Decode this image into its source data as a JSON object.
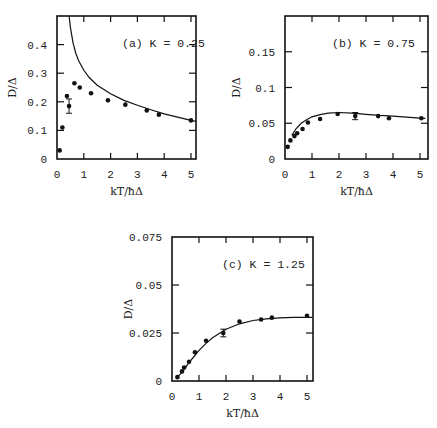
{
  "figure": {
    "panels": [
      "a",
      "b",
      "c"
    ]
  },
  "chart_data": [
    {
      "type": "scatter",
      "title": "(a)  K = 0.25",
      "xlabel": "kT/ħΔ",
      "ylabel": "D/Δ",
      "xlim": [
        0,
        5.2
      ],
      "ylim": [
        0,
        0.5
      ],
      "xticks": [
        0,
        1,
        2,
        3,
        4,
        5
      ],
      "yticks": [
        0,
        0.1,
        0.2,
        0.3,
        0.4
      ],
      "ytick_labels": [
        "0",
        "0.1",
        "0.2",
        "0.3",
        "0.4"
      ],
      "grid": false,
      "series": [
        {
          "name": "simulation points",
          "kind": "points",
          "x": [
            0.1,
            0.2,
            0.37,
            0.45,
            0.65,
            0.85,
            1.27,
            1.9,
            2.55,
            3.35,
            3.8,
            5.0
          ],
          "y": [
            0.03,
            0.11,
            0.22,
            0.185,
            0.265,
            0.25,
            0.23,
            0.205,
            0.19,
            0.17,
            0.155,
            0.135
          ],
          "error_bar": {
            "index": 3,
            "plus_minus": 0.025
          }
        },
        {
          "name": "theory curve",
          "kind": "line",
          "x": [
            0.45,
            0.5,
            0.6,
            0.7,
            0.8,
            1.0,
            1.2,
            1.5,
            2.0,
            2.5,
            3.0,
            3.5,
            4.0,
            4.5,
            5.0,
            5.2
          ],
          "y": [
            0.5,
            0.46,
            0.405,
            0.37,
            0.345,
            0.31,
            0.285,
            0.258,
            0.228,
            0.205,
            0.188,
            0.172,
            0.158,
            0.146,
            0.135,
            0.131
          ]
        }
      ]
    },
    {
      "type": "scatter",
      "title": "(b)  K = 0.75",
      "xlabel": "kT/ħΔ",
      "ylabel": "D/Δ",
      "xlim": [
        0,
        5.3
      ],
      "ylim": [
        0,
        0.2
      ],
      "xticks": [
        0,
        1,
        2,
        3,
        4,
        5
      ],
      "yticks": [
        0,
        0.05,
        0.1,
        0.15
      ],
      "ytick_labels": [
        "0",
        "0.05",
        "0.1",
        "0.15"
      ],
      "grid": false,
      "series": [
        {
          "name": "simulation points",
          "kind": "points",
          "x": [
            0.1,
            0.2,
            0.35,
            0.45,
            0.65,
            0.85,
            1.3,
            1.95,
            2.6,
            3.45,
            3.85,
            5.05
          ],
          "y": [
            0.017,
            0.026,
            0.032,
            0.036,
            0.042,
            0.051,
            0.056,
            0.063,
            0.06,
            0.06,
            0.057,
            0.057
          ],
          "error_bar": {
            "index": 8,
            "plus_minus": 0.005
          }
        },
        {
          "name": "theory curve",
          "kind": "line",
          "x": [
            0.25,
            0.4,
            0.6,
            0.8,
            1.0,
            1.3,
            1.6,
            2.0,
            2.5,
            3.0,
            3.5,
            4.0,
            4.5,
            5.0,
            5.2
          ],
          "y": [
            0.033,
            0.042,
            0.05,
            0.055,
            0.059,
            0.062,
            0.064,
            0.065,
            0.064,
            0.0625,
            0.061,
            0.0598,
            0.0585,
            0.0572,
            0.0568
          ]
        }
      ]
    },
    {
      "type": "scatter",
      "title": "(c)  K = 1.25",
      "xlabel": "kT/ħΔ",
      "ylabel": "D/Δ",
      "xlim": [
        0,
        5.2
      ],
      "ylim": [
        0,
        0.075
      ],
      "xticks": [
        0,
        1,
        2,
        3,
        4,
        5
      ],
      "yticks": [
        0,
        0.025,
        0.05,
        0.075
      ],
      "ytick_labels": [
        "0",
        "0.025",
        "0.05",
        "0.075"
      ],
      "grid": false,
      "series": [
        {
          "name": "simulation points",
          "kind": "points",
          "x": [
            0.2,
            0.37,
            0.45,
            0.63,
            0.85,
            1.26,
            1.9,
            2.5,
            3.3,
            3.7,
            5.0
          ],
          "y": [
            0.002,
            0.005,
            0.007,
            0.01,
            0.015,
            0.021,
            0.025,
            0.031,
            0.032,
            0.033,
            0.034
          ],
          "error_bar": {
            "index": 6,
            "plus_minus": 0.002
          }
        },
        {
          "name": "theory curve",
          "kind": "line",
          "x": [
            0.2,
            0.4,
            0.6,
            0.8,
            1.0,
            1.25,
            1.5,
            2.0,
            2.5,
            3.0,
            3.5,
            4.0,
            4.5,
            5.0,
            5.2
          ],
          "y": [
            0.002,
            0.005,
            0.009,
            0.0125,
            0.016,
            0.0195,
            0.0225,
            0.027,
            0.0298,
            0.0315,
            0.0324,
            0.0329,
            0.0331,
            0.0332,
            0.0332
          ]
        }
      ]
    }
  ]
}
